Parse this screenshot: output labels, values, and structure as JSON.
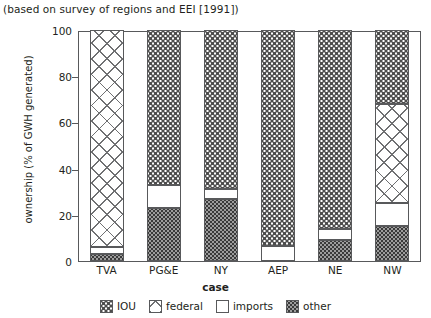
{
  "caption": "(based on survey of regions and EEI [1991])",
  "axes": {
    "ylabel": "ownership (% of GWH generated)",
    "xlabel": "case",
    "yticks": [
      0,
      20,
      40,
      60,
      80,
      100
    ],
    "ylim": [
      0,
      100
    ]
  },
  "legend": {
    "title": "case",
    "items": [
      {
        "label": "IOU",
        "pattern": "p-iou",
        "swatch_name": "legend-swatch-iou"
      },
      {
        "label": "federal",
        "pattern": "p-federal",
        "swatch_name": "legend-swatch-federal"
      },
      {
        "label": "imports",
        "pattern": "p-imports",
        "swatch_name": "legend-swatch-imports"
      },
      {
        "label": "other",
        "pattern": "p-other",
        "swatch_name": "legend-swatch-other"
      }
    ]
  },
  "chart_data": {
    "type": "bar",
    "stacked": true,
    "title": "",
    "subtitle": "(based on survey of regions and EEI [1991])",
    "xlabel": "case",
    "ylabel": "ownership (% of GWH generated)",
    "ylim": [
      0,
      100
    ],
    "yticks": [
      0,
      20,
      40,
      60,
      80,
      100
    ],
    "grid": false,
    "legend_position": "bottom",
    "categories": [
      "TVA",
      "PG&E",
      "NY",
      "AEP",
      "NE",
      "NW"
    ],
    "series": [
      {
        "name": "other",
        "values": [
          3,
          23,
          27,
          0,
          9,
          15
        ]
      },
      {
        "name": "imports",
        "values": [
          3,
          10,
          4,
          6.5,
          5,
          10
        ]
      },
      {
        "name": "federal",
        "values": [
          94,
          0,
          0,
          0,
          0,
          43
        ]
      },
      {
        "name": "IOU",
        "values": [
          0,
          67,
          69,
          93.5,
          86,
          32
        ]
      }
    ],
    "stack_order_bottom_to_top": [
      "other",
      "imports",
      "federal",
      "IOU"
    ],
    "bars": [
      {
        "category": "TVA",
        "segments": [
          {
            "series": "other",
            "from": 0,
            "to": 3
          },
          {
            "series": "imports",
            "from": 3,
            "to": 6
          },
          {
            "series": "federal",
            "from": 6,
            "to": 100
          }
        ]
      },
      {
        "category": "PG&E",
        "segments": [
          {
            "series": "other",
            "from": 0,
            "to": 23
          },
          {
            "series": "imports",
            "from": 23,
            "to": 33
          },
          {
            "series": "IOU",
            "from": 33,
            "to": 100
          }
        ]
      },
      {
        "category": "NY",
        "segments": [
          {
            "series": "other",
            "from": 0,
            "to": 27
          },
          {
            "series": "imports",
            "from": 27,
            "to": 31
          },
          {
            "series": "IOU",
            "from": 31,
            "to": 100
          }
        ]
      },
      {
        "category": "AEP",
        "segments": [
          {
            "series": "imports",
            "from": 0,
            "to": 6.5
          },
          {
            "series": "IOU",
            "from": 6.5,
            "to": 100
          }
        ]
      },
      {
        "category": "NE",
        "segments": [
          {
            "series": "other",
            "from": 0,
            "to": 9
          },
          {
            "series": "imports",
            "from": 9,
            "to": 14
          },
          {
            "series": "IOU",
            "from": 14,
            "to": 100
          }
        ]
      },
      {
        "category": "NW",
        "segments": [
          {
            "series": "other",
            "from": 0,
            "to": 15
          },
          {
            "series": "imports",
            "from": 15,
            "to": 25
          },
          {
            "series": "federal",
            "from": 25,
            "to": 68
          },
          {
            "series": "IOU",
            "from": 68,
            "to": 100
          }
        ]
      }
    ]
  },
  "style": {
    "frame_color": "#58595b",
    "text_color": "#231f20"
  }
}
